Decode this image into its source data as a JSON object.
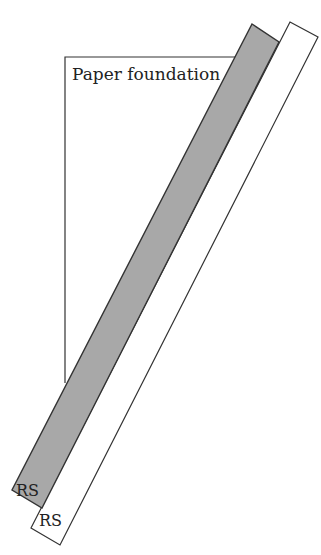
{
  "diagram": {
    "labels": {
      "paper": "Paper foundation",
      "strip_gray": "RS",
      "strip_white": "RS"
    },
    "colors": {
      "gray_strip": "#a8a8a8",
      "stroke": "#333333"
    }
  }
}
